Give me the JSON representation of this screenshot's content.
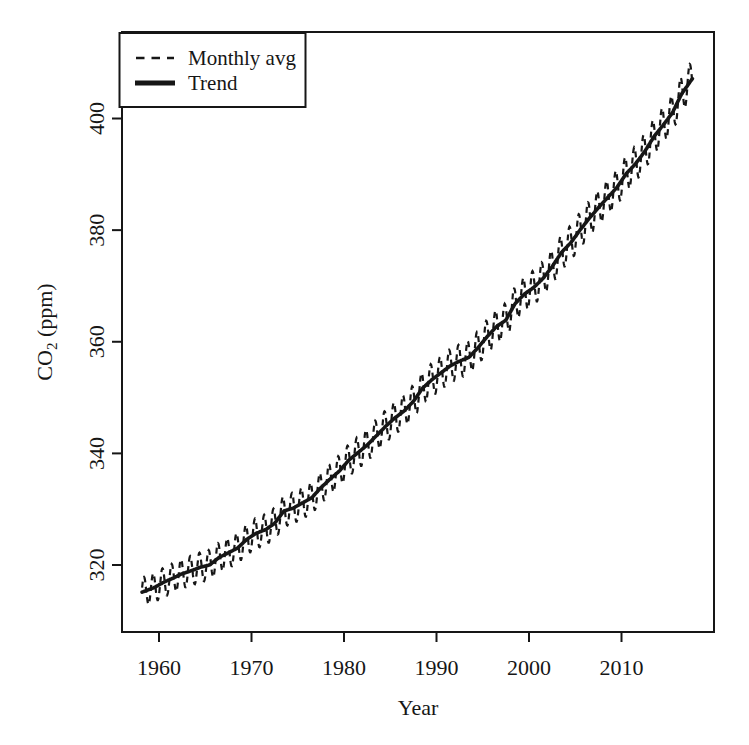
{
  "figure": {
    "background": "#ffffff",
    "ink_color": "#161616"
  },
  "chart_data": {
    "type": "line",
    "title": "",
    "xlabel": "Year",
    "ylabel": "CO2 (ppm)",
    "ylabel_parts": {
      "main": "CO",
      "sub": "2",
      "rest": " (ppm)"
    },
    "xlim": [
      1956,
      2020
    ],
    "ylim": [
      308,
      415.5
    ],
    "x_ticks": [
      1960,
      1970,
      1980,
      1990,
      2000,
      2010
    ],
    "y_ticks": [
      320,
      340,
      360,
      380,
      400
    ],
    "grid": false,
    "legend": {
      "position": "top-left",
      "items": [
        {
          "label": "Monthly avg",
          "style": "dashed"
        },
        {
          "label": "Trend",
          "style": "solid-thick"
        }
      ]
    },
    "series": [
      {
        "name": "Monthly avg",
        "type": "line",
        "style": "dashed",
        "derivation": "trend_annual_mean + seasonal_cycle",
        "x_start": 1958.17,
        "x_end": 2017.7
      },
      {
        "name": "Trend",
        "type": "line",
        "style": "solid-thick",
        "x_start": 1958.17,
        "x_end": 2017.7,
        "years": [
          1958,
          1959,
          1960,
          1961,
          1962,
          1963,
          1964,
          1965,
          1966,
          1967,
          1968,
          1969,
          1970,
          1971,
          1972,
          1973,
          1974,
          1975,
          1976,
          1977,
          1978,
          1979,
          1980,
          1981,
          1982,
          1983,
          1984,
          1985,
          1986,
          1987,
          1988,
          1989,
          1990,
          1991,
          1992,
          1993,
          1994,
          1995,
          1996,
          1997,
          1998,
          1999,
          2000,
          2001,
          2002,
          2003,
          2004,
          2005,
          2006,
          2007,
          2008,
          2009,
          2010,
          2011,
          2012,
          2013,
          2014,
          2015,
          2016,
          2017
        ],
        "annual_mean_ppm": [
          315.34,
          315.97,
          316.91,
          317.64,
          318.45,
          318.99,
          319.62,
          320.04,
          321.37,
          322.18,
          323.05,
          324.62,
          325.68,
          326.32,
          327.46,
          329.68,
          330.19,
          331.12,
          332.03,
          333.84,
          335.41,
          336.84,
          338.76,
          340.12,
          341.48,
          343.15,
          344.85,
          346.35,
          347.61,
          349.31,
          351.69,
          353.2,
          354.45,
          355.7,
          356.54,
          357.21,
          358.96,
          360.97,
          362.74,
          363.88,
          366.84,
          368.54,
          369.71,
          371.32,
          373.45,
          375.98,
          377.7,
          379.98,
          382.09,
          384.02,
          385.83,
          387.64,
          390.1,
          391.85,
          394.06,
          396.74,
          398.81,
          401.01,
          404.41,
          406.76
        ]
      }
    ],
    "seasonal_cycle": {
      "amplitude_ppm_start": 2.6,
      "amplitude_ppm_end": 3.3,
      "peak_month": "May",
      "trough_month": "October",
      "phase_fraction": 0.12
    }
  }
}
